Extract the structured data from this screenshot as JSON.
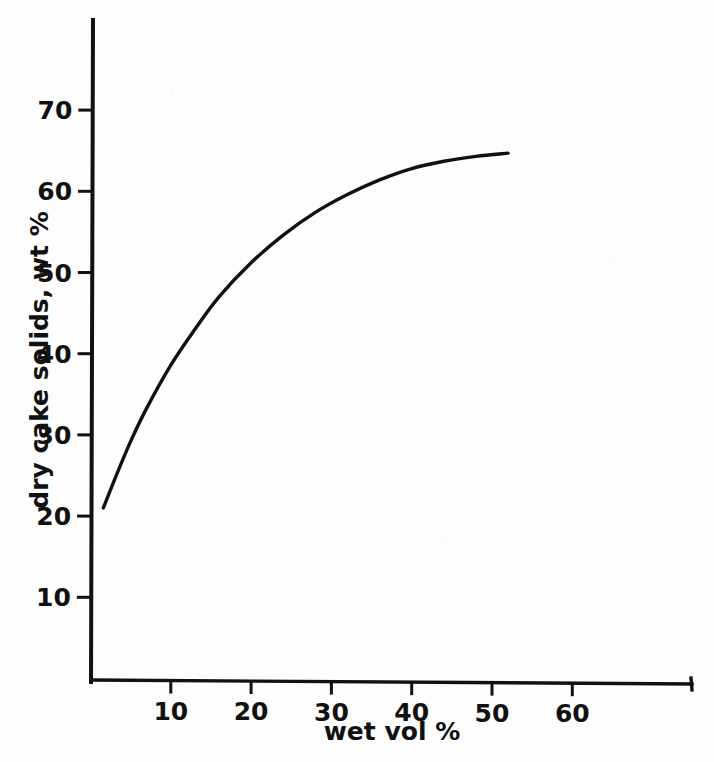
{
  "figure": {
    "background_color": "#fdfdfd",
    "ink_color": "#111111"
  },
  "chart_data": {
    "type": "line",
    "title": "",
    "subtitle": "",
    "xlabel": "wet  vol %",
    "ylabel": "dry cake solids, wt %",
    "xlim": [
      0,
      74.8
    ],
    "ylim": [
      0,
      81
    ],
    "grid": false,
    "legend": false,
    "legend_position": "none",
    "xticks": [
      10,
      20,
      30,
      40,
      50,
      60
    ],
    "xticklabels": [
      "10",
      "20",
      "30",
      "40",
      "50",
      "60"
    ],
    "yticks": [
      10,
      20,
      30,
      40,
      50,
      60,
      70
    ],
    "yticklabels": [
      "10",
      "20",
      "30",
      "40",
      "50",
      "60",
      "70"
    ],
    "series": [
      {
        "name": "dry cake solids vs wet vol",
        "x": [
          1.6,
          3,
          5,
          7,
          10,
          13,
          16,
          20,
          24,
          28,
          32,
          36,
          40,
          44,
          48,
          52
        ],
        "y": [
          21.0,
          24.5,
          29.2,
          33.3,
          38.6,
          43.0,
          47.0,
          51.2,
          54.6,
          57.4,
          59.6,
          61.4,
          62.8,
          63.7,
          64.3,
          64.7
        ]
      }
    ],
    "annotations": []
  },
  "axes": {
    "x_axis_name": "wet-volume-axis",
    "y_axis_name": "dry-cake-solids-axis"
  }
}
